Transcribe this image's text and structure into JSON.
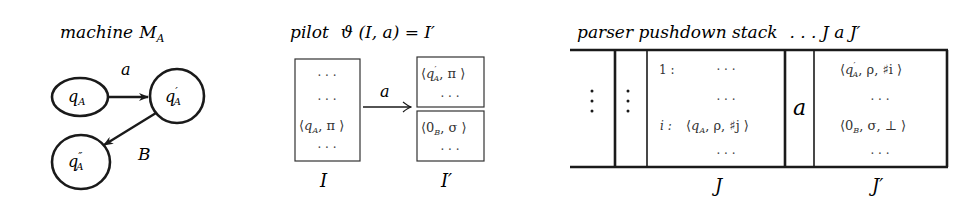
{
  "machine": {
    "title": "machine",
    "title_symbol": "M",
    "title_sub": "A",
    "states": [
      {
        "id": "qA",
        "label": "q",
        "prime": "",
        "sub": "A"
      },
      {
        "id": "qA1",
        "label": "q",
        "prime": "′",
        "sub": "A"
      },
      {
        "id": "qA2",
        "label": "q",
        "prime": "″",
        "sub": "A"
      }
    ],
    "transitions": [
      {
        "from": "qA",
        "to": "qA1",
        "label": "a"
      },
      {
        "from": "qA1",
        "to": "qA2",
        "label": "B"
      }
    ]
  },
  "pilot": {
    "title": "pilot",
    "formula": "ϑ (I, a) = I′",
    "arrow_label": "a",
    "state_I": {
      "name": "I",
      "rows": [
        "· · ·",
        "· · ·",
        "⟨q",
        "· · ·"
      ],
      "item_row": {
        "q": "q",
        "sub": "A",
        "rest": ", π ⟩"
      }
    },
    "state_I1": {
      "name": "I′",
      "upper_rows": {
        "item": {
          "q": "q",
          "prime": "′",
          "sub": "A",
          "rest": ", π ⟩"
        },
        "dots": "· · ·"
      },
      "lower_rows": {
        "item": {
          "q": "0",
          "sub": "B",
          "rest": ", σ ⟩"
        },
        "dots": "· · ·"
      }
    }
  },
  "parser": {
    "title": "parser pushdown stack",
    "title_tail": ". . . J a J′",
    "left_dots": "⋮",
    "J": {
      "name": "J",
      "rows": [
        {
          "index": "1 :",
          "content": "· · ·"
        },
        {
          "index": "",
          "content": "· · ·"
        },
        {
          "index": "i :",
          "content_q": "q",
          "content_sub": "A",
          "content_rest": ", ρ, ♯j ⟩"
        },
        {
          "index": "",
          "content": "· · ·"
        }
      ]
    },
    "terminal": "a",
    "J1": {
      "name": "J′",
      "rows": [
        {
          "q": "q",
          "prime": "′",
          "sub": "A",
          "rest": ", ρ, ♯i ⟩"
        },
        {
          "content": "· · ·"
        },
        {
          "q": "0",
          "sub": "B",
          "rest": ", σ, ⊥ ⟩"
        },
        {
          "content": "· · ·"
        }
      ]
    }
  }
}
